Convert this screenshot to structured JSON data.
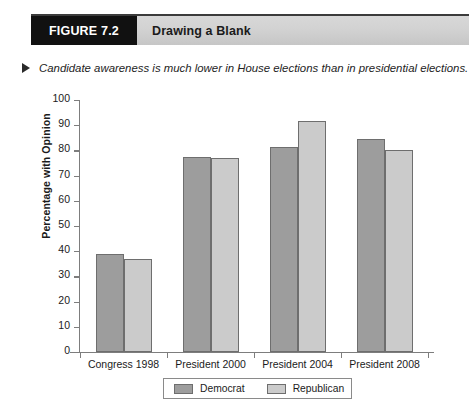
{
  "figure": {
    "tab_label": "FIGURE 7.2",
    "title": "Drawing a Blank",
    "caption": "Candidate awareness is much lower in House elections than in presidential elections."
  },
  "colors": {
    "democrat_bar": "#9d9d9d",
    "republican_bar": "#cbcbcb",
    "bar_outline": "#6e6e6e",
    "axis": "#7d7d7d",
    "tab_background": "#111111",
    "banner_background": "#d2d2d2"
  },
  "chart_data": {
    "type": "bar",
    "title": "Drawing a Blank",
    "subtitle": "Candidate awareness is much lower in House elections than in presidential elections.",
    "xlabel": "",
    "ylabel": "Percentage with Opinion",
    "ylim": [
      0,
      100
    ],
    "ytick_labels": [
      "0",
      "10",
      "20",
      "30",
      "40",
      "50",
      "60",
      "70",
      "80",
      "90",
      "100"
    ],
    "ytick_values": [
      0,
      10,
      20,
      30,
      40,
      50,
      60,
      70,
      80,
      90,
      100
    ],
    "grid": false,
    "legend_position": "bottom",
    "categories": [
      "Congress 1998",
      "President 2000",
      "President 2004",
      "President 2008"
    ],
    "series": [
      {
        "name": "Democrat",
        "color": "#9d9d9d",
        "values": [
          39,
          77.5,
          81.5,
          84.5
        ]
      },
      {
        "name": "Republican",
        "color": "#cbcbcb",
        "values": [
          37,
          77,
          91.5,
          80
        ]
      }
    ]
  }
}
